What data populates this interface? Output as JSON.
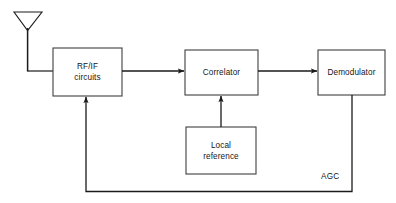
{
  "diagram": {
    "canvas": {
      "width": 396,
      "height": 203
    },
    "style": {
      "background": "#ffffff",
      "line_color": "#1a1a1a",
      "box_stroke": "#3a3a3a",
      "box_fill": "#ffffff",
      "text_color": "#161616"
    },
    "blocks": [
      {
        "id": "rf-if",
        "label_line1": "RF/IF",
        "label_line2": "circuits",
        "x": 53,
        "y": 48,
        "w": 69,
        "h": 48
      },
      {
        "id": "correlator",
        "label_line1": "Correlator",
        "label_line2": "",
        "x": 185,
        "y": 50,
        "w": 73,
        "h": 45
      },
      {
        "id": "demodulator",
        "label_line1": "Demodulator",
        "label_line2": "",
        "x": 318,
        "y": 50,
        "w": 67,
        "h": 45
      },
      {
        "id": "local-reference",
        "label_line1": "Local",
        "label_line2": "reference",
        "x": 186,
        "y": 127,
        "w": 70,
        "h": 47
      }
    ],
    "antenna": {
      "name": "receiving-antenna",
      "left_tip_x": 14,
      "right_tip_x": 42,
      "top_y": 12,
      "apex_x": 27,
      "apex_y": 30,
      "mast_bottom_y": 71
    },
    "connections": [
      {
        "id": "antenna-to-rfif",
        "from": "antenna",
        "to": "rf-if",
        "arrow": false
      },
      {
        "id": "rfif-to-correlator",
        "from": "rf-if",
        "to": "correlator",
        "arrow": true
      },
      {
        "id": "correlator-to-demodulator",
        "from": "correlator",
        "to": "demodulator",
        "arrow": true
      },
      {
        "id": "localref-to-correlator",
        "from": "local-reference",
        "to": "correlator",
        "arrow": true
      },
      {
        "id": "demodulator-to-rfif-agc",
        "from": "demodulator",
        "to": "rf-if",
        "arrow": true,
        "label": "AGC"
      }
    ],
    "edge_labels": [
      {
        "id": "agc-label",
        "text": "AGC",
        "x": 321,
        "y": 173
      }
    ]
  }
}
